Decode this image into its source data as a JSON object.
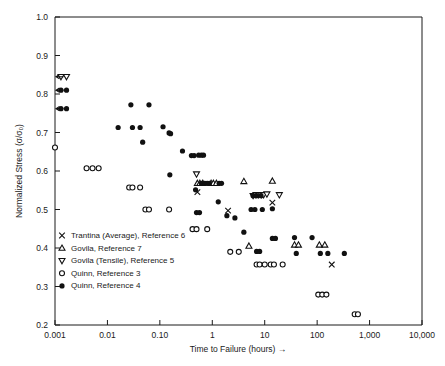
{
  "chart_data": {
    "type": "scatter",
    "title": "",
    "xlabel": "Time to Failure (hours) →",
    "ylabel": "Normalized Stress (σ/σ₀)",
    "xscale": "log",
    "yscale": "linear",
    "xlim": [
      0.001,
      10000
    ],
    "ylim": [
      0.2,
      1.0
    ],
    "grid": false,
    "legend_position": "lower-left-inside",
    "xticks": [
      {
        "value": 0.001,
        "label": "0.001"
      },
      {
        "value": 0.01,
        "label": "0.01"
      },
      {
        "value": 0.1,
        "label": "0.10"
      },
      {
        "value": 1,
        "label": "1"
      },
      {
        "value": 10,
        "label": "10"
      },
      {
        "value": 100,
        "label": "100"
      },
      {
        "value": 1000,
        "label": "1,000"
      },
      {
        "value": 10000,
        "label": "10,000"
      }
    ],
    "yticks": [
      {
        "value": 1.0,
        "label": "1.0"
      },
      {
        "value": 0.9,
        "label": "0.9"
      },
      {
        "value": 0.8,
        "label": "0.8"
      },
      {
        "value": 0.7,
        "label": "0.7"
      },
      {
        "value": 0.6,
        "label": "0.6"
      },
      {
        "value": 0.5,
        "label": "0.5"
      },
      {
        "value": 0.4,
        "label": "0.4"
      },
      {
        "value": 0.3,
        "label": "0.3"
      },
      {
        "value": 0.2,
        "label": "0.2"
      }
    ],
    "series": [
      {
        "name": "Trantina (Average), Reference 6",
        "marker": "x",
        "filled": false,
        "points": [
          [
            0.52,
            0.545
          ],
          [
            2.0,
            0.497
          ],
          [
            14.0,
            0.518
          ],
          [
            190.0,
            0.357
          ]
        ]
      },
      {
        "name": "Govila, Reference 7",
        "marker": "triangle-up",
        "filled": false,
        "points": [
          [
            0.52,
            0.568
          ],
          [
            0.58,
            0.568
          ],
          [
            0.66,
            0.568
          ],
          [
            0.95,
            0.568
          ],
          [
            1.05,
            0.568
          ],
          [
            1.2,
            0.568
          ],
          [
            4.0,
            0.573
          ],
          [
            14.0,
            0.574
          ],
          [
            5.0,
            0.405
          ],
          [
            37.0,
            0.408
          ],
          [
            44.0,
            0.408
          ],
          [
            110.0,
            0.408
          ],
          [
            140.0,
            0.408
          ]
        ]
      },
      {
        "name": "Govila (Tensile), Reference 5",
        "marker": "triangle-down",
        "filled": false,
        "points": [
          [
            0.0013,
            0.845
          ],
          [
            0.5,
            0.592
          ],
          [
            6.0,
            0.536
          ],
          [
            6.8,
            0.538
          ],
          [
            7.6,
            0.538
          ],
          [
            8.6,
            0.538
          ],
          [
            9.5,
            0.538
          ],
          [
            11.0,
            0.54
          ],
          [
            19.0,
            0.538
          ]
        ]
      },
      {
        "name": "Quinn, Reference 3",
        "marker": "circle",
        "filled": false,
        "points": [
          [
            0.001,
            0.661
          ],
          [
            0.004,
            0.607
          ],
          [
            0.0052,
            0.607
          ],
          [
            0.0068,
            0.607
          ],
          [
            0.026,
            0.557
          ],
          [
            0.03,
            0.557
          ],
          [
            0.042,
            0.557
          ],
          [
            0.053,
            0.5
          ],
          [
            0.062,
            0.5
          ],
          [
            0.15,
            0.5
          ],
          [
            0.42,
            0.449
          ],
          [
            0.5,
            0.449
          ],
          [
            0.8,
            0.449
          ],
          [
            2.2,
            0.39
          ],
          [
            3.2,
            0.39
          ],
          [
            7.0,
            0.357
          ],
          [
            8.0,
            0.357
          ],
          [
            10.0,
            0.357
          ],
          [
            13.0,
            0.357
          ],
          [
            15.0,
            0.357
          ],
          [
            22.0,
            0.357
          ],
          [
            105.0,
            0.279
          ],
          [
            125.0,
            0.279
          ],
          [
            150.0,
            0.279
          ],
          [
            520.0,
            0.228
          ],
          [
            600.0,
            0.228
          ]
        ]
      },
      {
        "name": "Quinn, Reference 4",
        "marker": "circle",
        "filled": true,
        "points": [
          [
            0.0013,
            0.81
          ],
          [
            0.0013,
            0.762
          ],
          [
            0.016,
            0.713
          ],
          [
            0.028,
            0.772
          ],
          [
            0.03,
            0.713
          ],
          [
            0.042,
            0.713
          ],
          [
            0.047,
            0.675
          ],
          [
            0.062,
            0.772
          ],
          [
            0.115,
            0.715
          ],
          [
            0.15,
            0.699
          ],
          [
            0.16,
            0.697
          ],
          [
            0.155,
            0.59
          ],
          [
            0.27,
            0.652
          ],
          [
            0.4,
            0.64
          ],
          [
            0.45,
            0.64
          ],
          [
            0.55,
            0.641
          ],
          [
            0.62,
            0.641
          ],
          [
            0.68,
            0.641
          ],
          [
            0.48,
            0.551
          ],
          [
            0.62,
            0.568
          ],
          [
            0.72,
            0.568
          ],
          [
            0.8,
            0.568
          ],
          [
            0.88,
            0.568
          ],
          [
            1.35,
            0.568
          ],
          [
            1.5,
            0.568
          ],
          [
            0.5,
            0.492
          ],
          [
            0.57,
            0.492
          ],
          [
            1.3,
            0.52
          ],
          [
            1.9,
            0.484
          ],
          [
            2.7,
            0.478
          ],
          [
            4.0,
            0.441
          ],
          [
            6.0,
            0.536
          ],
          [
            7.0,
            0.536
          ],
          [
            8.5,
            0.536
          ],
          [
            5.5,
            0.5
          ],
          [
            6.5,
            0.5
          ],
          [
            9.0,
            0.5
          ],
          [
            7.0,
            0.391
          ],
          [
            8.0,
            0.391
          ],
          [
            14.0,
            0.502
          ],
          [
            14.0,
            0.425
          ],
          [
            16.0,
            0.425
          ],
          [
            37.0,
            0.427
          ],
          [
            80.0,
            0.427
          ],
          [
            40.0,
            0.386
          ],
          [
            115.0,
            0.386
          ],
          [
            160.0,
            0.386
          ],
          [
            330.0,
            0.386
          ]
        ]
      }
    ],
    "left_arrow_points": [
      {
        "y": 0.845,
        "marker": "triangle-down"
      },
      {
        "y": 0.81,
        "marker": "circle-filled"
      },
      {
        "y": 0.762,
        "marker": "circle-filled"
      }
    ]
  },
  "legend": {
    "entries": [
      {
        "marker": "x",
        "label": "Trantina (Average), Reference 6"
      },
      {
        "marker": "triangle-up",
        "label": "Govila, Reference 7"
      },
      {
        "marker": "triangle-down",
        "label": "Govila (Tensile), Reference 5"
      },
      {
        "marker": "circle-open",
        "label": "Quinn, Reference 3"
      },
      {
        "marker": "circle-filled",
        "label": "Quinn, Reference 4"
      }
    ]
  },
  "colors": {
    "ink": "#1a1a1a",
    "marker": "#111111",
    "background": "#ffffff"
  }
}
